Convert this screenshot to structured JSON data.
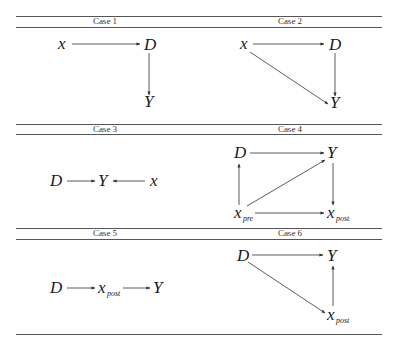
{
  "table": {
    "rows": [
      {
        "cases": [
          {
            "id": "case-1",
            "label": "Case 1",
            "nodes": [
              "x",
              "D",
              "Y"
            ],
            "edges": [
              [
                "x",
                "D"
              ],
              [
                "D",
                "Y"
              ]
            ]
          },
          {
            "id": "case-2",
            "label": "Case 2",
            "nodes": [
              "x",
              "D",
              "Y"
            ],
            "edges": [
              [
                "x",
                "D"
              ],
              [
                "D",
                "Y"
              ],
              [
                "x",
                "Y"
              ]
            ]
          }
        ]
      },
      {
        "cases": [
          {
            "id": "case-3",
            "label": "Case 3",
            "nodes": [
              "D",
              "Y",
              "x"
            ],
            "edges": [
              [
                "D",
                "Y"
              ],
              [
                "x",
                "Y"
              ]
            ]
          },
          {
            "id": "case-4",
            "label": "Case 4",
            "nodes": [
              "D",
              "Y",
              "x_pre",
              "x_post"
            ],
            "edges": [
              [
                "D",
                "Y"
              ],
              [
                "x_pre",
                "D"
              ],
              [
                "x_pre",
                "Y"
              ],
              [
                "Y",
                "x_post"
              ],
              [
                "x_pre",
                "x_post"
              ]
            ]
          }
        ]
      },
      {
        "cases": [
          {
            "id": "case-5",
            "label": "Case 5",
            "nodes": [
              "D",
              "x_post",
              "Y"
            ],
            "edges": [
              [
                "D",
                "x_post"
              ],
              [
                "x_post",
                "Y"
              ]
            ]
          },
          {
            "id": "case-6",
            "label": "Case 6",
            "nodes": [
              "D",
              "Y",
              "x_post"
            ],
            "edges": [
              [
                "D",
                "Y"
              ],
              [
                "D",
                "x_post"
              ],
              [
                "x_post",
                "Y"
              ]
            ]
          }
        ]
      }
    ]
  },
  "labels": {
    "case1": "Case 1",
    "case2": "Case 2",
    "case3": "Case 3",
    "case4": "Case 4",
    "case5": "Case 5",
    "case6": "Case 6"
  },
  "symbols": {
    "x": "x",
    "D": "D",
    "Y": "Y",
    "x_base": "x",
    "pre": "pre",
    "post": "post"
  }
}
